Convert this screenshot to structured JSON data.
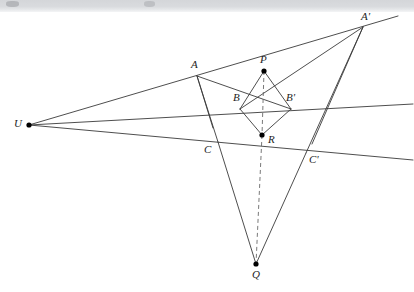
{
  "figure": {
    "background_color": "#ffffff",
    "line_color": "#3a3a3a",
    "dashed_color": "#6a6a6a",
    "point_color": "#000000",
    "label_color": "#1d1d1d",
    "scan_band_color": "#d6d8db",
    "width": 414,
    "height": 292
  },
  "points": [
    {
      "id": "U",
      "label": "U",
      "x": 29,
      "y": 125,
      "label_x": 14,
      "label_y": 118,
      "dot": true
    },
    {
      "id": "A",
      "label": "A",
      "x": 197,
      "y": 76,
      "label_x": 191,
      "label_y": 59,
      "dot": false
    },
    {
      "id": "Ap",
      "label": "A'",
      "x": 363,
      "y": 27,
      "label_x": 361,
      "label_y": 11,
      "dot": false
    },
    {
      "id": "B",
      "label": "B",
      "x": 240,
      "y": 109,
      "label_x": 233,
      "label_y": 92,
      "dot": false
    },
    {
      "id": "Bp",
      "label": "B'",
      "x": 291,
      "y": 109,
      "label_x": 286,
      "label_y": 92,
      "dot": false
    },
    {
      "id": "C",
      "label": "C",
      "x": 218,
      "y": 142,
      "label_x": 204,
      "label_y": 144,
      "dot": false
    },
    {
      "id": "Cp",
      "label": "C'",
      "x": 306,
      "y": 153,
      "label_x": 309,
      "label_y": 154,
      "dot": false
    },
    {
      "id": "P",
      "label": "P",
      "x": 264,
      "y": 71,
      "label_x": 260,
      "label_y": 54,
      "dot": true
    },
    {
      "id": "R",
      "label": "R",
      "x": 262,
      "y": 135,
      "label_x": 268,
      "label_y": 134,
      "dot": true
    },
    {
      "id": "Q",
      "label": "Q",
      "x": 256,
      "y": 264,
      "label_x": 252,
      "label_y": 269,
      "dot": true
    }
  ],
  "solid_segments": [
    {
      "name": "ray-U-through-A-to-Aprime",
      "x1": 29,
      "y1": 125,
      "x2": 398,
      "y2": 16
    },
    {
      "name": "ray-U-through-B-Bprime",
      "x1": 29,
      "y1": 125,
      "x2": 413,
      "y2": 104
    },
    {
      "name": "ray-U-through-C-Cprime",
      "x1": 29,
      "y1": 125,
      "x2": 413,
      "y2": 160
    },
    {
      "name": "edge-A-to-C",
      "x1": 197,
      "y1": 76,
      "x2": 218,
      "y2": 142
    },
    {
      "name": "edge-A-to-Bprime",
      "x1": 197,
      "y1": 76,
      "x2": 291,
      "y2": 109
    },
    {
      "name": "edge-Aprime-to-B",
      "x1": 363,
      "y1": 27,
      "x2": 240,
      "y2": 109
    },
    {
      "name": "edge-Aprime-to-Cprime",
      "x1": 363,
      "y1": 27,
      "x2": 306,
      "y2": 153
    },
    {
      "name": "edge-P-to-B",
      "x1": 264,
      "y1": 71,
      "x2": 240,
      "y2": 109
    },
    {
      "name": "edge-P-to-Bprime",
      "x1": 264,
      "y1": 71,
      "x2": 291,
      "y2": 109
    },
    {
      "name": "edge-R-to-B",
      "x1": 262,
      "y1": 135,
      "x2": 240,
      "y2": 109
    },
    {
      "name": "edge-R-to-Bprime",
      "x1": 262,
      "y1": 135,
      "x2": 291,
      "y2": 109
    },
    {
      "name": "edge-C-to-Q",
      "x1": 218,
      "y1": 142,
      "x2": 256,
      "y2": 264
    },
    {
      "name": "edge-Cprime-to-Q",
      "x1": 306,
      "y1": 153,
      "x2": 256,
      "y2": 264
    },
    {
      "name": "edge-A-to-B-short",
      "x1": 197,
      "y1": 76,
      "x2": 213,
      "y2": 128
    },
    {
      "name": "edge-Aprime-to-Cprime-low",
      "x1": 363,
      "y1": 27,
      "x2": 312,
      "y2": 144
    }
  ],
  "dashed_segments": [
    {
      "name": "dashed-P-to-R",
      "x1": 264,
      "y1": 71,
      "x2": 262,
      "y2": 135
    },
    {
      "name": "dashed-R-to-Q",
      "x1": 262,
      "y1": 135,
      "x2": 256,
      "y2": 264
    }
  ]
}
